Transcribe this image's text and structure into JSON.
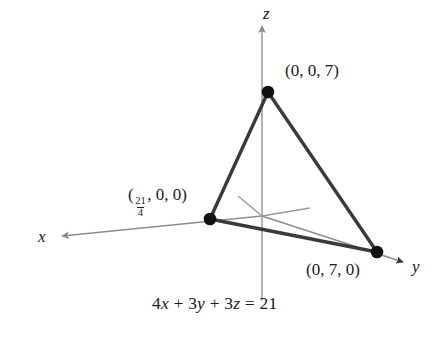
{
  "figure": {
    "type": "3d-plane-intercepts-diagram",
    "background_color": "#ffffff",
    "width": 443,
    "height": 342
  },
  "axes": {
    "x_label": "x",
    "y_label": "y",
    "z_label": "z",
    "axis_color": "#8c8c8c",
    "origin": {
      "x": 262,
      "y": 216
    }
  },
  "points": [
    {
      "name": "z-intercept",
      "label": "(0, 0, 7)",
      "coords": [
        0,
        0,
        7
      ],
      "px": {
        "x": 268,
        "y": 92
      }
    },
    {
      "name": "x-intercept",
      "label_prefix": "(",
      "numerator": "21",
      "denominator": "4",
      "label_suffix": ", 0, 0)",
      "coords": [
        "21/4",
        0,
        0
      ],
      "px": {
        "x": 210,
        "y": 219
      }
    },
    {
      "name": "y-intercept",
      "label": "(0, 7, 0)",
      "coords": [
        0,
        7,
        0
      ],
      "px": {
        "x": 377,
        "y": 252
      }
    }
  ],
  "plane": {
    "equation_parts": {
      "c1": "4",
      "v1": "x",
      "op1": "+",
      "c2": "3",
      "v2": "y",
      "op2": "+",
      "c3": "3",
      "v3": "z",
      "eq": "=",
      "rhs": "21"
    },
    "equation_text": "4x + 3y + 3z = 21",
    "edge_color": "#333333",
    "dot_color": "#111111"
  }
}
